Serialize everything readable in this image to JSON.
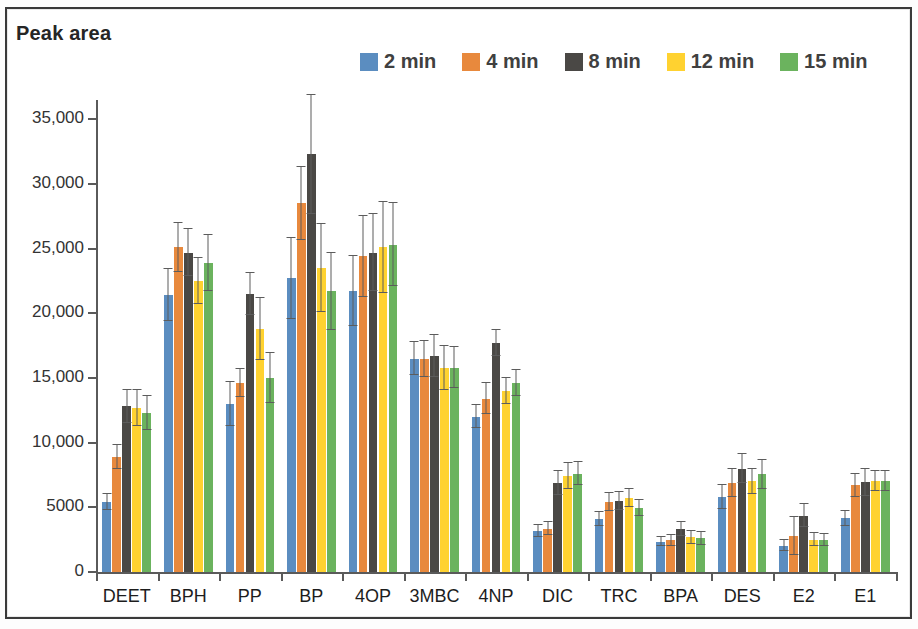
{
  "chart_data": {
    "type": "bar",
    "title": "Peak area",
    "ylabel": "Peak area",
    "xlabel": "",
    "grid": false,
    "legend_position": "top-right",
    "ylim": [
      0,
      36500
    ],
    "yticks": [
      0,
      5000,
      10000,
      15000,
      20000,
      25000,
      30000,
      35000
    ],
    "ytick_labels": [
      "0",
      "5000",
      "10,000",
      "15,000",
      "20,000",
      "25,000",
      "30,000",
      "35,000"
    ],
    "categories": [
      "DEET",
      "BPH",
      "PP",
      "BP",
      "4OP",
      "3MBC",
      "4NP",
      "DIC",
      "TRC",
      "BPA",
      "DES",
      "E2",
      "E1"
    ],
    "series": [
      {
        "name": "2 min",
        "color": "#5B8DC0",
        "values": [
          5400,
          21400,
          13000,
          22700,
          21700,
          16500,
          12000,
          3150,
          4100,
          2350,
          5800,
          2050,
          4150
        ],
        "errors": [
          600,
          2000,
          1700,
          3100,
          2700,
          1300,
          900,
          450,
          550,
          350,
          900,
          400,
          600
        ]
      },
      {
        "name": "4 min",
        "color": "#E8893D",
        "values": [
          8900,
          25100,
          14600,
          28500,
          24400,
          16500,
          13400,
          3350,
          5400,
          2450,
          6900,
          2800,
          6700
        ],
        "errors": [
          900,
          1900,
          1100,
          2800,
          3100,
          1400,
          1200,
          500,
          700,
          400,
          1100,
          1450,
          900
        ]
      },
      {
        "name": "8 min",
        "color": "#4A4845",
        "values": [
          12800,
          24700,
          21500,
          32300,
          24700,
          16700,
          17700,
          6900,
          5500,
          3300,
          8000,
          4350,
          6950
        ],
        "errors": [
          1300,
          1800,
          1600,
          4600,
          3000,
          1600,
          1000,
          950,
          700,
          550,
          1100,
          900,
          1050
        ]
      },
      {
        "name": "12 min",
        "color": "#FFD230",
        "values": [
          12700,
          22500,
          18800,
          23500,
          25100,
          15800,
          14000,
          7400,
          5700,
          2700,
          7000,
          2500,
          7050
        ],
        "errors": [
          1400,
          1800,
          2400,
          3400,
          3500,
          1700,
          1000,
          1000,
          700,
          500,
          1000,
          500,
          800
        ]
      },
      {
        "name": "15 min",
        "color": "#6BB35E",
        "values": [
          12300,
          23900,
          15000,
          21700,
          25300,
          15800,
          14600,
          7600,
          4950,
          2600,
          7550,
          2500,
          7050
        ],
        "errors": [
          1300,
          2200,
          1900,
          3000,
          3200,
          1600,
          1000,
          900,
          650,
          500,
          1100,
          450,
          800
        ]
      }
    ]
  },
  "legend": {
    "items": [
      {
        "label": "2 min"
      },
      {
        "label": "4 min"
      },
      {
        "label": "8 min"
      },
      {
        "label": "12 min"
      },
      {
        "label": "15 min"
      }
    ]
  }
}
